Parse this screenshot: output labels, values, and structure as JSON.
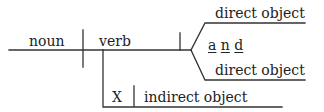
{
  "diagram": {
    "type": "sentence-diagram",
    "line_color": "#333333",
    "text_color": "#222222",
    "labels": {
      "subject": "noun",
      "predicate": "verb",
      "direct_object_1": "direct object",
      "conjunction": [
        "a",
        "n",
        "d"
      ],
      "direct_object_2": "direct object",
      "preposition_placeholder": "X",
      "indirect_object": "indirect object"
    }
  }
}
